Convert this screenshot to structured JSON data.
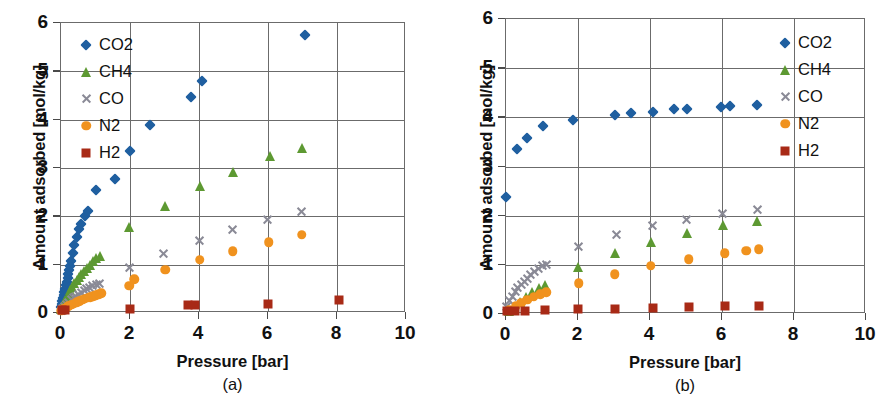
{
  "figure": {
    "panels": [
      {
        "id": "a",
        "caption": "(a)",
        "legend_position": "inside-top-left"
      },
      {
        "id": "b",
        "caption": "(b)",
        "legend_position": "inside-top-right"
      }
    ]
  },
  "axis": {
    "ylabel": "Amount adsorbed [mol/kg]",
    "xlabel": "Pressure [bar]",
    "yticks": [
      "0",
      "1",
      "2",
      "3",
      "4",
      "5",
      "6"
    ],
    "xticks": [
      "0",
      "2",
      "4",
      "6",
      "8",
      "10"
    ]
  },
  "colors": {
    "co2": "#1f5fa0",
    "ch4": "#5d9932",
    "co": "#8a8a96",
    "n2": "#f0921e",
    "h2": "#a82a16",
    "axis": "#6b6b6b",
    "text": "#111111",
    "background": "#ffffff"
  },
  "legend": {
    "entries": [
      {
        "label": "CO2",
        "marker": "diamond",
        "color": "#1f5fa0"
      },
      {
        "label": "CH4",
        "marker": "triangle",
        "color": "#5d9932"
      },
      {
        "label": "CO",
        "marker": "cross",
        "color": "#8a8a96"
      },
      {
        "label": "N2",
        "marker": "circle",
        "color": "#f0921e"
      },
      {
        "label": "H2",
        "marker": "square",
        "color": "#a82a16"
      }
    ]
  },
  "chart_data": [
    {
      "type": "scatter",
      "panel": "a",
      "title": "(a)",
      "xlabel": "Pressure [bar]",
      "ylabel": "Amount adsorbed [mol/kg]",
      "xlim": [
        0,
        10
      ],
      "ylim": [
        0,
        6
      ],
      "xticks": [
        0,
        2,
        4,
        6,
        8,
        10
      ],
      "yticks": [
        0,
        1,
        2,
        3,
        4,
        5,
        6
      ],
      "grid": true,
      "legend_position": "upper left",
      "series": [
        {
          "name": "CO2",
          "marker": "diamond",
          "color": "#1f5fa0",
          "points": [
            [
              0.02,
              0.1
            ],
            [
              0.05,
              0.16
            ],
            [
              0.07,
              0.22
            ],
            [
              0.09,
              0.29
            ],
            [
              0.11,
              0.35
            ],
            [
              0.13,
              0.42
            ],
            [
              0.15,
              0.48
            ],
            [
              0.17,
              0.55
            ],
            [
              0.19,
              0.62
            ],
            [
              0.22,
              0.7
            ],
            [
              0.24,
              0.78
            ],
            [
              0.27,
              0.86
            ],
            [
              0.3,
              0.95
            ],
            [
              0.33,
              1.05
            ],
            [
              0.37,
              1.22
            ],
            [
              0.42,
              1.38
            ],
            [
              0.48,
              1.55
            ],
            [
              0.55,
              1.72
            ],
            [
              0.62,
              1.82
            ],
            [
              0.72,
              1.98
            ],
            [
              0.82,
              2.08
            ],
            [
              1.05,
              2.52
            ],
            [
              1.6,
              2.76
            ],
            [
              2.02,
              3.34
            ],
            [
              2.62,
              3.87
            ],
            [
              3.8,
              4.44
            ],
            [
              4.12,
              4.77
            ],
            [
              7.1,
              5.73
            ]
          ]
        },
        {
          "name": "CH4",
          "marker": "triangle",
          "color": "#5d9932",
          "points": [
            [
              0.03,
              0.06
            ],
            [
              0.07,
              0.12
            ],
            [
              0.11,
              0.18
            ],
            [
              0.15,
              0.24
            ],
            [
              0.2,
              0.3
            ],
            [
              0.25,
              0.38
            ],
            [
              0.3,
              0.45
            ],
            [
              0.36,
              0.52
            ],
            [
              0.42,
              0.6
            ],
            [
              0.48,
              0.66
            ],
            [
              0.55,
              0.72
            ],
            [
              0.62,
              0.78
            ],
            [
              0.7,
              0.85
            ],
            [
              0.78,
              0.92
            ],
            [
              0.86,
              0.98
            ],
            [
              0.95,
              1.05
            ],
            [
              1.05,
              1.12
            ],
            [
              1.15,
              1.15
            ],
            [
              2.0,
              1.76
            ],
            [
              3.05,
              2.2
            ],
            [
              4.05,
              2.6
            ],
            [
              5.0,
              2.9
            ],
            [
              6.1,
              3.22
            ],
            [
              7.0,
              3.4
            ]
          ]
        },
        {
          "name": "CO",
          "marker": "cross",
          "color": "#8a8a96",
          "points": [
            [
              0.03,
              0.04
            ],
            [
              0.08,
              0.08
            ],
            [
              0.13,
              0.12
            ],
            [
              0.19,
              0.16
            ],
            [
              0.25,
              0.2
            ],
            [
              0.32,
              0.25
            ],
            [
              0.39,
              0.29
            ],
            [
              0.46,
              0.33
            ],
            [
              0.54,
              0.37
            ],
            [
              0.62,
              0.41
            ],
            [
              0.7,
              0.45
            ],
            [
              0.78,
              0.48
            ],
            [
              0.86,
              0.51
            ],
            [
              0.95,
              0.54
            ],
            [
              1.05,
              0.57
            ],
            [
              1.15,
              0.59
            ],
            [
              2.0,
              0.93
            ],
            [
              3.0,
              1.22
            ],
            [
              4.05,
              1.48
            ],
            [
              5.0,
              1.71
            ],
            [
              6.0,
              1.91
            ],
            [
              7.0,
              2.08
            ]
          ]
        },
        {
          "name": "N2",
          "marker": "circle",
          "color": "#f0921e",
          "points": [
            [
              0.04,
              0.03
            ],
            [
              0.1,
              0.06
            ],
            [
              0.17,
              0.09
            ],
            [
              0.24,
              0.12
            ],
            [
              0.32,
              0.15
            ],
            [
              0.4,
              0.17
            ],
            [
              0.48,
              0.2
            ],
            [
              0.56,
              0.22
            ],
            [
              0.64,
              0.25
            ],
            [
              0.72,
              0.27
            ],
            [
              0.8,
              0.29
            ],
            [
              0.88,
              0.31
            ],
            [
              0.96,
              0.33
            ],
            [
              1.04,
              0.35
            ],
            [
              1.12,
              0.37
            ],
            [
              1.2,
              0.39
            ],
            [
              2.0,
              0.54
            ],
            [
              2.15,
              0.68
            ],
            [
              3.05,
              0.87
            ],
            [
              4.05,
              1.08
            ],
            [
              5.0,
              1.26
            ],
            [
              6.05,
              1.44
            ],
            [
              7.0,
              1.6
            ]
          ]
        },
        {
          "name": "H2",
          "marker": "square",
          "color": "#a82a16",
          "points": [
            [
              0.05,
              0.05
            ],
            [
              0.15,
              0.05
            ],
            [
              2.02,
              0.06
            ],
            [
              3.7,
              0.14
            ],
            [
              3.9,
              0.14
            ],
            [
              6.02,
              0.17
            ],
            [
              8.1,
              0.24
            ]
          ]
        }
      ]
    },
    {
      "type": "scatter",
      "panel": "b",
      "title": "(b)",
      "xlabel": "Pressure [bar]",
      "ylabel": "Amount adsorbed [mol/kg]",
      "xlim": [
        0,
        10
      ],
      "ylim": [
        0,
        6
      ],
      "xticks": [
        0,
        2,
        4,
        6,
        8,
        10
      ],
      "yticks": [
        0,
        1,
        2,
        3,
        4,
        5,
        6
      ],
      "grid": true,
      "legend_position": "upper right",
      "series": [
        {
          "name": "CO2",
          "marker": "diamond",
          "color": "#1f5fa0",
          "points": [
            [
              0.02,
              2.36
            ],
            [
              0.32,
              3.33
            ],
            [
              0.62,
              3.56
            ],
            [
              1.05,
              3.8
            ],
            [
              1.9,
              3.92
            ],
            [
              3.05,
              4.02
            ],
            [
              3.5,
              4.06
            ],
            [
              4.1,
              4.09
            ],
            [
              4.7,
              4.14
            ],
            [
              5.05,
              4.14
            ],
            [
              6.0,
              4.2
            ],
            [
              6.25,
              4.21
            ],
            [
              7.0,
              4.24
            ]
          ]
        },
        {
          "name": "CH4",
          "marker": "triangle",
          "color": "#5d9932",
          "points": [
            [
              0.1,
              0.05
            ],
            [
              0.25,
              0.12
            ],
            [
              0.42,
              0.22
            ],
            [
              0.58,
              0.32
            ],
            [
              0.75,
              0.42
            ],
            [
              0.95,
              0.5
            ],
            [
              1.12,
              0.56
            ],
            [
              2.02,
              0.94
            ],
            [
              3.05,
              1.23
            ],
            [
              4.05,
              1.44
            ],
            [
              5.05,
              1.62
            ],
            [
              6.05,
              1.78
            ],
            [
              7.0,
              1.87
            ]
          ]
        },
        {
          "name": "CO",
          "marker": "cross",
          "color": "#8a8a96",
          "points": [
            [
              0.04,
              0.14
            ],
            [
              0.12,
              0.25
            ],
            [
              0.2,
              0.34
            ],
            [
              0.28,
              0.43
            ],
            [
              0.36,
              0.51
            ],
            [
              0.45,
              0.58
            ],
            [
              0.54,
              0.65
            ],
            [
              0.63,
              0.71
            ],
            [
              0.72,
              0.78
            ],
            [
              0.82,
              0.84
            ],
            [
              0.92,
              0.9
            ],
            [
              1.05,
              0.96
            ],
            [
              1.15,
              0.99
            ],
            [
              2.05,
              1.35
            ],
            [
              3.1,
              1.6
            ],
            [
              4.1,
              1.78
            ],
            [
              5.05,
              1.9
            ],
            [
              6.05,
              2.03
            ],
            [
              7.0,
              2.1
            ]
          ]
        },
        {
          "name": "N2",
          "marker": "circle",
          "color": "#f0921e",
          "points": [
            [
              0.12,
              0.06
            ],
            [
              0.3,
              0.14
            ],
            [
              0.45,
              0.21
            ],
            [
              0.62,
              0.27
            ],
            [
              0.8,
              0.33
            ],
            [
              0.98,
              0.38
            ],
            [
              1.15,
              0.42
            ],
            [
              2.05,
              0.61
            ],
            [
              3.05,
              0.79
            ],
            [
              4.05,
              0.96
            ],
            [
              5.1,
              1.09
            ],
            [
              6.1,
              1.22
            ],
            [
              6.7,
              1.27
            ],
            [
              7.05,
              1.3
            ]
          ]
        },
        {
          "name": "H2",
          "marker": "square",
          "color": "#a82a16",
          "points": [
            [
              0.05,
              0.04
            ],
            [
              0.28,
              0.05
            ],
            [
              0.55,
              0.05
            ],
            [
              1.1,
              0.06
            ],
            [
              2.02,
              0.08
            ],
            [
              3.05,
              0.09
            ],
            [
              4.1,
              0.11
            ],
            [
              5.1,
              0.13
            ],
            [
              6.1,
              0.14
            ],
            [
              7.05,
              0.14
            ]
          ]
        }
      ]
    }
  ]
}
